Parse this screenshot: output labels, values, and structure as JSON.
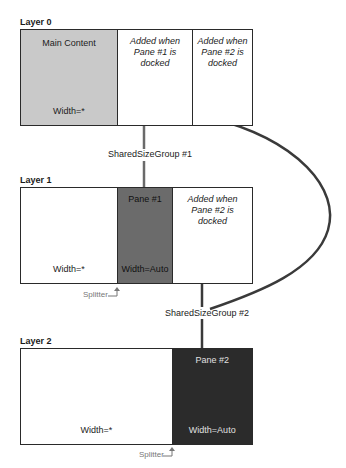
{
  "colors": {
    "main_content_fill": "#c9c9c9",
    "pane1_fill": "#6b6b6b",
    "pane2_fill": "#2b2b2b",
    "border": "#2a2a2a",
    "connector": "#6a6a6a",
    "curve": "#3a3a3a",
    "splitter_text": "#777777"
  },
  "layers": [
    {
      "label": "Layer 0",
      "cells": [
        {
          "title": "Main Content",
          "footer": "Width=*"
        },
        {
          "title": "Added when Pane #1 is docked"
        },
        {
          "title": "Added when Pane #2 is docked"
        }
      ]
    },
    {
      "label": "Layer 1",
      "cells": [
        {
          "footer": "Width=*"
        },
        {
          "title": "Pane #1",
          "footer": "Width=Auto"
        },
        {
          "title": "Added when Pane #2 is docked"
        }
      ],
      "splitter": "Splitter"
    },
    {
      "label": "Layer 2",
      "cells": [
        {
          "footer": "Width=*"
        },
        {
          "title": "Pane #2",
          "footer": "Width=Auto"
        }
      ],
      "splitter": "Splitter"
    }
  ],
  "shared_size_groups": [
    {
      "label": "SharedSizeGroup #1"
    },
    {
      "label": "SharedSizeGroup #2"
    }
  ]
}
